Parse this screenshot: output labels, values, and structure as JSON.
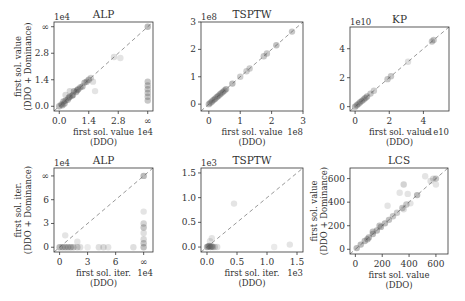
{
  "figure": {
    "width": 465,
    "height": 301
  },
  "chart_data": [
    {
      "id": "alp-value",
      "type": "scatter",
      "title": "ALP",
      "xlabel": [
        "first sol. value",
        "(DDO)"
      ],
      "ylabel": [
        "first sol. value",
        "(DDO + Dominance)"
      ],
      "x_offset_label": "1e4",
      "y_offset_label": "1e4",
      "box": [
        54,
        22,
        153,
        111
      ],
      "xlim": [
        -0.25,
        4.45
      ],
      "ylim": [
        -0.25,
        4.45
      ],
      "xticks": [
        [
          0,
          "0.0"
        ],
        [
          1.4,
          "1.4"
        ],
        [
          2.8,
          "2.8"
        ],
        [
          4.2,
          "∞"
        ]
      ],
      "yticks": [
        [
          0,
          "0.0"
        ],
        [
          1.4,
          "1.4"
        ],
        [
          2.8,
          "2.8"
        ],
        [
          4.2,
          "∞"
        ]
      ],
      "diagonal": true,
      "points": [
        [
          0,
          0,
          1
        ],
        [
          0.1,
          0.1,
          1
        ],
        [
          0.2,
          0.25,
          1
        ],
        [
          0.3,
          0.3,
          1
        ],
        [
          0.4,
          0.35,
          1
        ],
        [
          0.5,
          0.5,
          1
        ],
        [
          0.6,
          0.55,
          1
        ],
        [
          0.7,
          0.8,
          1
        ],
        [
          0.8,
          0.75,
          1
        ],
        [
          0.9,
          0.9,
          1
        ],
        [
          1.0,
          1.0,
          1
        ],
        [
          1.1,
          1.05,
          1
        ],
        [
          1.2,
          1.25,
          1
        ],
        [
          1.3,
          1.3,
          1
        ],
        [
          1.4,
          1.4,
          1
        ],
        [
          1.5,
          1.5,
          0.6
        ],
        [
          1.6,
          1.3,
          0.4
        ],
        [
          1.7,
          0.8,
          0.3
        ],
        [
          0.5,
          0.8,
          0.5
        ],
        [
          0.3,
          0.6,
          0.5
        ],
        [
          2.6,
          2.6,
          0.4
        ],
        [
          2.9,
          2.55,
          0.3
        ],
        [
          4.2,
          4.2,
          1
        ],
        [
          4.2,
          1.3,
          0.8
        ],
        [
          4.2,
          1.1,
          0.8
        ],
        [
          4.2,
          0.9,
          0.8
        ],
        [
          4.2,
          0.7,
          0.8
        ],
        [
          4.2,
          0.5,
          0.8
        ],
        [
          4.2,
          0.3,
          0.8
        ],
        [
          0.15,
          0.05,
          1
        ],
        [
          0.25,
          0.15,
          1
        ],
        [
          0.45,
          0.45,
          1
        ],
        [
          0.65,
          0.6,
          1
        ],
        [
          0.85,
          0.85,
          1
        ]
      ]
    },
    {
      "id": "tsptw-value",
      "type": "scatter",
      "title": "TSPTW",
      "xlabel": [
        "first sol. value",
        "(DDO)"
      ],
      "ylabel": [],
      "x_offset_label": "1e8",
      "y_offset_label": "1e8",
      "box": [
        201,
        22,
        303,
        111
      ],
      "xlim": [
        -0.25,
        3.0
      ],
      "ylim": [
        -0.25,
        3.0
      ],
      "xticks": [
        [
          0,
          "0"
        ],
        [
          1,
          "1"
        ],
        [
          2,
          "2"
        ],
        [
          3,
          "3"
        ]
      ],
      "yticks": [
        [
          0,
          "0"
        ],
        [
          1,
          "1"
        ],
        [
          2,
          "2"
        ],
        [
          3,
          "3"
        ]
      ],
      "diagonal": true,
      "points": [
        [
          0,
          0,
          1
        ],
        [
          0.05,
          0.05,
          1
        ],
        [
          0.1,
          0.1,
          1
        ],
        [
          0.15,
          0.15,
          1
        ],
        [
          0.2,
          0.2,
          1
        ],
        [
          0.25,
          0.25,
          1
        ],
        [
          0.3,
          0.3,
          1
        ],
        [
          0.35,
          0.35,
          1
        ],
        [
          0.4,
          0.4,
          1
        ],
        [
          0.45,
          0.45,
          1
        ],
        [
          0.5,
          0.5,
          1
        ],
        [
          0.55,
          0.55,
          1
        ],
        [
          0.75,
          0.75,
          1
        ],
        [
          1.0,
          1.0,
          0.7
        ],
        [
          1.2,
          1.2,
          0.7
        ],
        [
          1.3,
          1.3,
          0.7
        ],
        [
          1.75,
          1.75,
          0.8
        ],
        [
          1.85,
          1.85,
          0.8
        ],
        [
          2.15,
          2.15,
          0.9
        ],
        [
          2.65,
          2.65,
          0.8
        ]
      ]
    },
    {
      "id": "kp-value",
      "type": "scatter",
      "title": "KP",
      "xlabel": [
        "first sol. value",
        "(DDO)"
      ],
      "ylabel": [],
      "x_offset_label": "1e10",
      "y_offset_label": "1e10",
      "box": [
        350,
        27,
        449,
        111
      ],
      "xlim": [
        -0.3,
        5.5
      ],
      "ylim": [
        -0.3,
        5.5
      ],
      "xticks": [
        [
          0,
          "0"
        ],
        [
          2,
          "2"
        ],
        [
          4,
          "4"
        ]
      ],
      "yticks": [
        [
          0,
          "0"
        ],
        [
          2,
          "2"
        ],
        [
          4,
          "4"
        ]
      ],
      "diagonal": true,
      "points": [
        [
          0,
          0,
          1
        ],
        [
          0.1,
          0.1,
          1
        ],
        [
          0.2,
          0.2,
          1
        ],
        [
          0.3,
          0.3,
          1
        ],
        [
          0.4,
          0.4,
          1
        ],
        [
          0.5,
          0.5,
          1
        ],
        [
          0.6,
          0.6,
          1
        ],
        [
          0.7,
          0.7,
          1
        ],
        [
          0.9,
          0.9,
          0.8
        ],
        [
          1.1,
          1.1,
          0.7
        ],
        [
          1.9,
          1.9,
          0.8
        ],
        [
          2.1,
          2.1,
          0.8
        ],
        [
          3.1,
          3.1,
          0.4
        ],
        [
          4.5,
          4.5,
          0.8
        ],
        [
          4.6,
          4.6,
          0.8
        ]
      ]
    },
    {
      "id": "alp-iter",
      "type": "scatter",
      "title": "ALP",
      "xlabel": [
        "first sol. iter.",
        "(DDO)"
      ],
      "ylabel": [
        "first sol. iter.",
        "(DDO + Dominance)"
      ],
      "x_offset_label": "1e4",
      "y_offset_label": "1e4",
      "box": [
        54,
        168,
        153,
        252
      ],
      "xlim": [
        -0.6,
        10.0
      ],
      "ylim": [
        -0.6,
        10.0
      ],
      "xticks": [
        [
          0,
          "0"
        ],
        [
          3,
          "3"
        ],
        [
          6,
          "6"
        ],
        [
          9,
          "∞"
        ]
      ],
      "yticks": [
        [
          0,
          "0"
        ],
        [
          3,
          "3"
        ],
        [
          6,
          "6"
        ],
        [
          9,
          "∞"
        ]
      ],
      "diagonal": true,
      "points": [
        [
          0,
          0,
          1
        ],
        [
          0.3,
          0,
          1
        ],
        [
          0.6,
          0,
          1
        ],
        [
          0.9,
          0,
          1
        ],
        [
          1.2,
          0,
          1
        ],
        [
          1.5,
          0,
          0.8
        ],
        [
          1.9,
          0,
          0.6
        ],
        [
          2.2,
          0,
          0.4
        ],
        [
          0.6,
          1.5,
          0.3
        ],
        [
          1.9,
          0.7,
          0.3
        ],
        [
          3.0,
          0,
          0.2
        ],
        [
          4.2,
          0,
          0.4
        ],
        [
          4.7,
          0,
          0.5
        ],
        [
          5.2,
          0,
          0.3
        ],
        [
          7.9,
          0,
          0.4
        ],
        [
          9,
          9,
          1
        ],
        [
          9,
          0,
          0.9
        ],
        [
          9,
          0.5,
          0.8
        ],
        [
          9,
          1.0,
          0.5
        ],
        [
          9,
          2.5,
          0.8
        ],
        [
          9,
          3.0,
          0.6
        ],
        [
          9,
          4.5,
          0.3
        ],
        [
          9,
          1.8,
          0.4
        ]
      ]
    },
    {
      "id": "tsptw-iter",
      "type": "scatter",
      "title": "TSPTW",
      "xlabel": [
        "first sol. iter.",
        "(DDO)"
      ],
      "ylabel": [],
      "x_offset_label": "1e3",
      "y_offset_label": "1e3",
      "box": [
        201,
        168,
        303,
        252
      ],
      "xlim": [
        -0.1,
        1.6
      ],
      "ylim": [
        -0.1,
        1.6
      ],
      "xticks": [
        [
          0,
          "0.0"
        ],
        [
          0.5,
          "0.5"
        ],
        [
          1.0,
          "1.0"
        ],
        [
          1.5,
          "1.5"
        ]
      ],
      "yticks": [
        [
          0,
          "0.0"
        ],
        [
          0.5,
          "0.5"
        ],
        [
          1.0,
          "1.0"
        ],
        [
          1.5,
          "1.5"
        ]
      ],
      "diagonal": true,
      "points": [
        [
          0,
          0,
          1
        ],
        [
          0.02,
          0.01,
          1
        ],
        [
          0.04,
          0.02,
          1
        ],
        [
          0.06,
          0,
          1
        ],
        [
          0.08,
          0.01,
          1
        ],
        [
          0.1,
          0,
          0.7
        ],
        [
          0.13,
          0,
          0.5
        ],
        [
          0.17,
          0,
          0.4
        ],
        [
          0.05,
          0.12,
          0.3
        ],
        [
          0.08,
          0.18,
          0.3
        ],
        [
          0.45,
          0.88,
          0.3
        ],
        [
          1.12,
          0.0,
          0.2
        ],
        [
          1.38,
          0.05,
          0.3
        ]
      ]
    },
    {
      "id": "lcs-value",
      "type": "scatter",
      "title": "LCS",
      "xlabel": [
        "first sol. value",
        "(DDO)"
      ],
      "ylabel": [
        "first sol. value",
        "(DDO + Dominance)"
      ],
      "x_offset_label": "",
      "y_offset_label": "",
      "box": [
        350,
        168,
        448,
        254
      ],
      "xlim": [
        -40,
        690
      ],
      "ylim": [
        -40,
        690
      ],
      "xticks": [
        [
          0,
          "0"
        ],
        [
          200,
          "200"
        ],
        [
          400,
          "400"
        ],
        [
          600,
          "600"
        ]
      ],
      "yticks": [
        [
          0,
          "0"
        ],
        [
          200,
          "200"
        ],
        [
          400,
          "400"
        ],
        [
          600,
          "600"
        ]
      ],
      "diagonal": true,
      "points": [
        [
          10,
          10,
          1
        ],
        [
          40,
          40,
          1
        ],
        [
          70,
          70,
          1
        ],
        [
          100,
          100,
          1
        ],
        [
          130,
          130,
          1
        ],
        [
          160,
          160,
          1
        ],
        [
          190,
          190,
          1
        ],
        [
          220,
          220,
          1
        ],
        [
          250,
          250,
          0.9
        ],
        [
          280,
          280,
          0.8
        ],
        [
          310,
          310,
          0.7
        ],
        [
          350,
          350,
          0.8
        ],
        [
          380,
          380,
          0.8
        ],
        [
          460,
          460,
          1
        ],
        [
          240,
          370,
          0.3
        ],
        [
          330,
          480,
          0.3
        ],
        [
          360,
          550,
          0.6
        ],
        [
          390,
          470,
          0.3
        ],
        [
          360,
          340,
          0.4
        ],
        [
          410,
          390,
          0.3
        ],
        [
          520,
          620,
          0.3
        ],
        [
          560,
          580,
          0.4
        ],
        [
          600,
          600,
          0.8
        ],
        [
          600,
          550,
          0.3
        ],
        [
          580,
          600,
          0.5
        ],
        [
          130,
          150,
          0.9
        ],
        [
          180,
          200,
          0.9
        ],
        [
          90,
          85,
          1
        ]
      ]
    }
  ]
}
